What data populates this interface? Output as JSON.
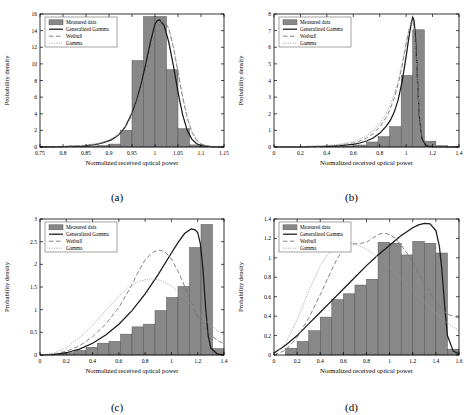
{
  "figure": {
    "type": "multi-panel-histogram-fit",
    "panels": 4,
    "captions": [
      "(a)",
      "(b)",
      "(c)",
      "(d)"
    ]
  },
  "legend": {
    "entries": [
      {
        "label": "Measured data",
        "style": "patch",
        "color": "#888888"
      },
      {
        "label": "Generalized Gamma",
        "style": "solid",
        "color": "#1a1a1a"
      },
      {
        "label": "Weibull",
        "style": "dashed",
        "color": "#777777"
      },
      {
        "label": "Gamma",
        "style": "dashdot",
        "color": "#999999"
      }
    ]
  },
  "chart_data": [
    {
      "type": "bar",
      "panel": "(a)",
      "title": "",
      "xlabel": "Normalized received optical power",
      "ylabel": "Probability density",
      "xlim": [
        0.75,
        1.15
      ],
      "ylim": [
        0,
        16
      ],
      "xticks": [
        0.75,
        0.8,
        0.85,
        0.9,
        0.95,
        1,
        1.05,
        1.1,
        1.15
      ],
      "xticklabels": [
        "0.75",
        "0.8",
        "0.85",
        "0.9",
        "0.95",
        "1",
        "1.05",
        "1.1",
        "1.15"
      ],
      "yticks": [
        0,
        2,
        4,
        6,
        8,
        10,
        12,
        14,
        16
      ],
      "yticklabels": [
        "0",
        "2",
        "4",
        "6",
        "8",
        "10",
        "12",
        "14",
        "16"
      ],
      "grid": false,
      "legend_position": "upper-left",
      "bin_edges": [
        0.75,
        0.775,
        0.8,
        0.825,
        0.85,
        0.875,
        0.9,
        0.925,
        0.95,
        0.975,
        1.0,
        1.025,
        1.05,
        1.075,
        1.1,
        1.125,
        1.15
      ],
      "values": [
        0.05,
        0.05,
        0.05,
        0.08,
        0.1,
        0.18,
        0.35,
        2.0,
        10.4,
        15.7,
        15.7,
        9.3,
        2.2,
        0.25,
        0.08,
        0.03
      ],
      "series": [
        {
          "name": "Generalized Gamma",
          "style": "solid",
          "x": [
            0.75,
            0.8,
            0.84,
            0.87,
            0.89,
            0.905,
            0.92,
            0.935,
            0.95,
            0.96,
            0.97,
            0.98,
            0.99,
            1.0,
            1.005,
            1.01,
            1.02,
            1.03,
            1.04,
            1.05,
            1.06,
            1.07,
            1.08,
            1.09,
            1.1,
            1.12,
            1.15
          ],
          "y": [
            0.02,
            0.05,
            0.12,
            0.3,
            0.55,
            0.85,
            1.4,
            2.4,
            4.1,
            5.6,
            7.6,
            10.0,
            12.6,
            14.8,
            15.2,
            15.3,
            14.6,
            12.6,
            9.8,
            6.6,
            3.9,
            2.0,
            0.95,
            0.42,
            0.18,
            0.04,
            0.01
          ]
        },
        {
          "name": "Weibull",
          "style": "dashed",
          "x": [
            0.75,
            0.8,
            0.85,
            0.88,
            0.9,
            0.92,
            0.94,
            0.955,
            0.97,
            0.98,
            0.99,
            1.0,
            1.01,
            1.02,
            1.03,
            1.04,
            1.05,
            1.06,
            1.07,
            1.08,
            1.09,
            1.1,
            1.12,
            1.15
          ],
          "y": [
            0.02,
            0.06,
            0.2,
            0.45,
            0.8,
            1.45,
            2.75,
            4.4,
            7.0,
            9.2,
            11.6,
            13.7,
            15.0,
            15.2,
            14.2,
            12.0,
            9.0,
            6.0,
            3.5,
            1.8,
            0.85,
            0.35,
            0.07,
            0.01
          ]
        },
        {
          "name": "Gamma",
          "style": "dashdot",
          "x": [
            0.75,
            0.8,
            0.85,
            0.88,
            0.9,
            0.92,
            0.94,
            0.955,
            0.97,
            0.98,
            0.99,
            1.0,
            1.01,
            1.02,
            1.03,
            1.04,
            1.05,
            1.06,
            1.07,
            1.08,
            1.09,
            1.1,
            1.12,
            1.15
          ],
          "y": [
            0.02,
            0.06,
            0.22,
            0.48,
            0.85,
            1.5,
            2.85,
            4.55,
            7.15,
            9.35,
            11.8,
            13.9,
            15.1,
            15.3,
            14.3,
            12.1,
            9.1,
            6.1,
            3.6,
            1.9,
            0.9,
            0.38,
            0.08,
            0.01
          ]
        }
      ]
    },
    {
      "type": "bar",
      "panel": "(b)",
      "title": "",
      "xlabel": "Normalized received optical power",
      "ylabel": "Probability density",
      "xlim": [
        0,
        1.4
      ],
      "ylim": [
        0,
        8
      ],
      "xticks": [
        0,
        0.2,
        0.4,
        0.6,
        0.8,
        1,
        1.2,
        1.4
      ],
      "xticklabels": [
        "0",
        "0.2",
        "0.4",
        "0.6",
        "0.8",
        "1",
        "1.2",
        "1.4"
      ],
      "yticks": [
        0,
        1,
        2,
        3,
        4,
        5,
        6,
        7,
        8
      ],
      "yticklabels": [
        "0",
        "1",
        "2",
        "3",
        "4",
        "5",
        "6",
        "7",
        "8"
      ],
      "grid": false,
      "legend_position": "upper-left",
      "bin_edges": [
        0.0,
        0.0875,
        0.175,
        0.2625,
        0.35,
        0.4375,
        0.525,
        0.6125,
        0.7,
        0.7875,
        0.875,
        0.9625,
        1.05,
        1.1375,
        1.225,
        1.3125,
        1.4
      ],
      "values": [
        0,
        0,
        0,
        0,
        0.02,
        0.03,
        0.05,
        0.12,
        0.3,
        0.62,
        1.22,
        4.3,
        7.05,
        0.35,
        0.08,
        0.02
      ],
      "series": [
        {
          "name": "Generalized Gamma",
          "style": "solid",
          "x": [
            0,
            0.2,
            0.4,
            0.5,
            0.6,
            0.65,
            0.7,
            0.75,
            0.8,
            0.85,
            0.88,
            0.91,
            0.94,
            0.97,
            1.0,
            1.02,
            1.04,
            1.05,
            1.06,
            1.07,
            1.08,
            1.09,
            1.1,
            1.12,
            1.15,
            1.2,
            1.4
          ],
          "y": [
            0,
            0.01,
            0.04,
            0.08,
            0.16,
            0.24,
            0.36,
            0.54,
            0.82,
            1.25,
            1.6,
            2.1,
            2.85,
            3.95,
            5.45,
            6.55,
            7.5,
            7.8,
            7.6,
            6.7,
            5.1,
            3.3,
            1.85,
            0.5,
            0.1,
            0.02,
            0
          ]
        },
        {
          "name": "Weibull",
          "style": "dashed",
          "x": [
            0,
            0.2,
            0.4,
            0.5,
            0.6,
            0.65,
            0.7,
            0.75,
            0.8,
            0.85,
            0.88,
            0.91,
            0.94,
            0.97,
            1.0,
            1.02,
            1.04,
            1.05,
            1.06,
            1.07,
            1.08,
            1.09,
            1.1,
            1.12,
            1.15,
            1.2,
            1.4
          ],
          "y": [
            0,
            0.02,
            0.06,
            0.12,
            0.24,
            0.36,
            0.54,
            0.8,
            1.2,
            1.8,
            2.3,
            2.95,
            3.8,
            4.9,
            6.2,
            7.0,
            7.55,
            7.6,
            7.2,
            6.2,
            4.8,
            3.2,
            1.95,
            0.62,
            0.16,
            0.03,
            0
          ]
        },
        {
          "name": "Gamma",
          "style": "dashdot",
          "x": [
            0,
            0.2,
            0.4,
            0.5,
            0.6,
            0.65,
            0.7,
            0.75,
            0.8,
            0.85,
            0.88,
            0.91,
            0.94,
            0.97,
            1.0,
            1.02,
            1.04,
            1.05,
            1.06,
            1.07,
            1.08,
            1.09,
            1.1,
            1.12,
            1.15,
            1.2,
            1.4
          ],
          "y": [
            0,
            0.03,
            0.09,
            0.17,
            0.32,
            0.47,
            0.68,
            0.98,
            1.42,
            2.05,
            2.55,
            3.2,
            4.0,
            5.05,
            6.3,
            7.05,
            7.5,
            7.5,
            7.1,
            6.15,
            4.85,
            3.35,
            2.15,
            0.8,
            0.28,
            0.07,
            0
          ]
        }
      ]
    },
    {
      "type": "bar",
      "panel": "(c)",
      "title": "",
      "xlabel": "Normalized received optical power",
      "ylabel": "Probability density",
      "xlim": [
        0,
        1.4
      ],
      "ylim": [
        0,
        3
      ],
      "xticks": [
        0,
        0.2,
        0.4,
        0.6,
        0.8,
        1,
        1.2,
        1.4
      ],
      "xticklabels": [
        "0",
        "0.2",
        "0.4",
        "0.6",
        "0.8",
        "1",
        "1.2",
        "1.4"
      ],
      "yticks": [
        0,
        0.5,
        1,
        1.5,
        2,
        2.5,
        3
      ],
      "yticklabels": [
        "0",
        "0.5",
        "1",
        "1.5",
        "2",
        "2.5",
        "3"
      ],
      "grid": false,
      "legend_position": "upper-left",
      "bin_edges": [
        0.0,
        0.0875,
        0.175,
        0.2625,
        0.35,
        0.4375,
        0.525,
        0.6125,
        0.7,
        0.7875,
        0.875,
        0.9625,
        1.05,
        1.1375,
        1.225,
        1.3125,
        1.4
      ],
      "values": [
        0,
        0.02,
        0.05,
        0.1,
        0.17,
        0.26,
        0.3,
        0.46,
        0.62,
        0.68,
        0.98,
        1.27,
        1.51,
        2.37,
        2.88,
        0.14
      ],
      "series": [
        {
          "name": "Generalized Gamma",
          "style": "solid",
          "x": [
            0,
            0.1,
            0.2,
            0.3,
            0.4,
            0.5,
            0.6,
            0.7,
            0.8,
            0.9,
            1.0,
            1.05,
            1.1,
            1.15,
            1.18,
            1.2,
            1.22,
            1.24,
            1.26,
            1.28,
            1.3,
            1.35,
            1.4
          ],
          "y": [
            0,
            0.01,
            0.05,
            0.13,
            0.26,
            0.44,
            0.68,
            0.98,
            1.35,
            1.78,
            2.25,
            2.48,
            2.68,
            2.78,
            2.76,
            2.7,
            2.45,
            1.9,
            1.05,
            0.42,
            0.15,
            0.02,
            0.005
          ]
        },
        {
          "name": "Weibull",
          "style": "dashed",
          "x": [
            0,
            0.1,
            0.2,
            0.3,
            0.4,
            0.5,
            0.6,
            0.65,
            0.7,
            0.75,
            0.8,
            0.85,
            0.9,
            0.95,
            1.0,
            1.05,
            1.1,
            1.15,
            1.2,
            1.25,
            1.3,
            1.35,
            1.4
          ],
          "y": [
            0,
            0.02,
            0.08,
            0.2,
            0.4,
            0.68,
            1.05,
            1.3,
            1.55,
            1.85,
            2.1,
            2.25,
            2.32,
            2.28,
            2.12,
            1.85,
            1.52,
            1.18,
            0.86,
            0.62,
            0.44,
            0.32,
            0.25
          ]
        },
        {
          "name": "Gamma",
          "style": "dashdot",
          "x": [
            0,
            0.1,
            0.2,
            0.3,
            0.4,
            0.5,
            0.6,
            0.65,
            0.7,
            0.75,
            0.8,
            0.85,
            0.9,
            0.95,
            1.0,
            1.05,
            1.1,
            1.15,
            1.2,
            1.25,
            1.3,
            1.35,
            1.4
          ],
          "y": [
            0,
            0.04,
            0.16,
            0.38,
            0.66,
            0.98,
            1.3,
            1.44,
            1.55,
            1.62,
            1.66,
            1.68,
            1.66,
            1.6,
            1.52,
            1.4,
            1.26,
            1.1,
            0.95,
            0.8,
            0.66,
            0.54,
            0.44
          ]
        }
      ]
    },
    {
      "type": "bar",
      "panel": "(d)",
      "title": "",
      "xlabel": "Normalized received optical power",
      "ylabel": "Probability density",
      "xlim": [
        0,
        1.6
      ],
      "ylim": [
        0,
        1.4
      ],
      "xticks": [
        0,
        0.2,
        0.4,
        0.6,
        0.8,
        1,
        1.2,
        1.4,
        1.6
      ],
      "xticklabels": [
        "0",
        "0.2",
        "0.4",
        "0.6",
        "0.8",
        "1",
        "1.2",
        "1.4",
        "1.6"
      ],
      "yticks": [
        0,
        0.2,
        0.4,
        0.6,
        0.8,
        1,
        1.2,
        1.4
      ],
      "yticklabels": [
        "0",
        "0.2",
        "0.4",
        "0.6",
        "0.8",
        "1",
        "1.2",
        "1.4"
      ],
      "grid": false,
      "legend_position": "upper-left",
      "bin_edges": [
        0.0,
        0.1,
        0.2,
        0.3,
        0.4,
        0.5,
        0.6,
        0.7,
        0.8,
        0.9,
        1.0,
        1.1,
        1.2,
        1.3,
        1.4,
        1.5,
        1.6
      ],
      "values": [
        0,
        0.07,
        0.14,
        0.25,
        0.39,
        0.57,
        0.63,
        0.72,
        0.78,
        1.16,
        1.15,
        1.03,
        1.17,
        1.15,
        1.05,
        0.06
      ],
      "series": [
        {
          "name": "Generalized Gamma",
          "style": "solid",
          "x": [
            0,
            0.1,
            0.2,
            0.3,
            0.4,
            0.5,
            0.6,
            0.7,
            0.8,
            0.9,
            1.0,
            1.1,
            1.2,
            1.25,
            1.3,
            1.35,
            1.4,
            1.43,
            1.45,
            1.48,
            1.5,
            1.55,
            1.6
          ],
          "y": [
            0.02,
            0.1,
            0.2,
            0.32,
            0.44,
            0.56,
            0.68,
            0.8,
            0.92,
            1.03,
            1.13,
            1.23,
            1.31,
            1.34,
            1.355,
            1.35,
            1.28,
            1.12,
            0.9,
            0.45,
            0.2,
            0.04,
            0.01
          ]
        },
        {
          "name": "Weibull",
          "style": "dashed",
          "x": [
            0,
            0.1,
            0.2,
            0.3,
            0.4,
            0.5,
            0.55,
            0.6,
            0.65,
            0.7,
            0.75,
            0.8,
            0.85,
            0.9,
            0.95,
            1.0,
            1.05,
            1.1,
            1.15,
            1.2,
            1.3,
            1.4,
            1.45,
            1.5,
            1.55,
            1.6
          ],
          "y": [
            0,
            0.05,
            0.18,
            0.38,
            0.62,
            0.88,
            1.0,
            1.08,
            1.13,
            1.145,
            1.15,
            1.16,
            1.2,
            1.24,
            1.255,
            1.24,
            1.2,
            1.13,
            1.05,
            0.95,
            0.74,
            0.55,
            0.47,
            0.42,
            0.4,
            0.38
          ]
        },
        {
          "name": "Gamma",
          "style": "dashdot",
          "x": [
            0,
            0.1,
            0.2,
            0.3,
            0.4,
            0.45,
            0.5,
            0.55,
            0.6,
            0.65,
            0.7,
            0.75,
            0.8,
            0.85,
            0.9,
            0.95,
            1.0,
            1.05,
            1.1,
            1.2,
            1.3,
            1.4,
            1.45,
            1.5,
            1.55,
            1.6
          ],
          "y": [
            0,
            0.12,
            0.36,
            0.66,
            0.92,
            1.01,
            1.08,
            1.12,
            1.145,
            1.15,
            1.145,
            1.12,
            1.09,
            1.05,
            1.0,
            0.95,
            0.9,
            0.84,
            0.78,
            0.66,
            0.54,
            0.43,
            0.38,
            0.33,
            0.29,
            0.25
          ]
        }
      ]
    }
  ]
}
